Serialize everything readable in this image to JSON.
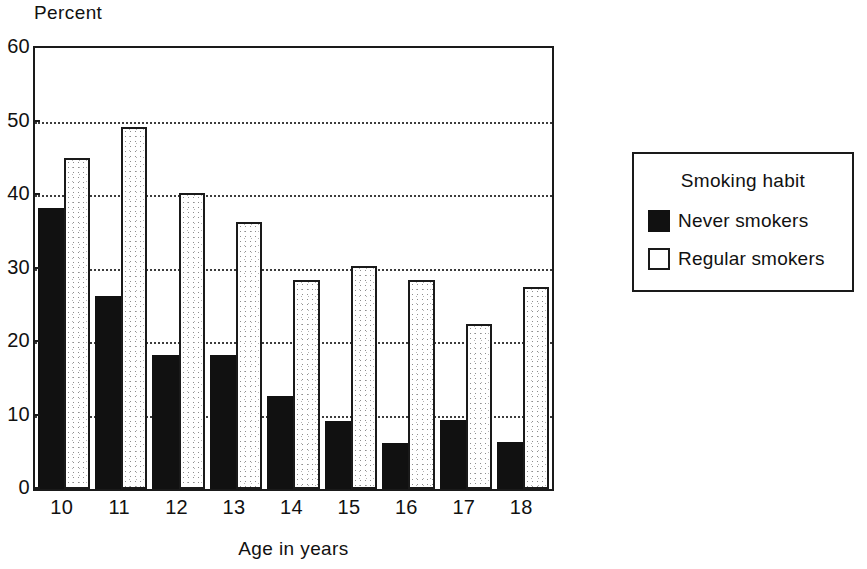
{
  "chart_data": {
    "type": "bar",
    "title": "",
    "xlabel": "Age in years",
    "ylabel": "Percent",
    "categories": [
      "10",
      "11",
      "12",
      "13",
      "14",
      "15",
      "16",
      "17",
      "18"
    ],
    "series": [
      {
        "name": "Never smokers",
        "color": "#111111",
        "values": [
          38.3,
          26.3,
          18.3,
          18.3,
          12.7,
          9.2,
          6.3,
          9.4,
          6.4
        ]
      },
      {
        "name": "Regular smokers",
        "color": "#ffffff",
        "values": [
          45.1,
          49.2,
          40.3,
          36.3,
          28.4,
          30.4,
          28.5,
          22.5,
          27.5
        ]
      }
    ],
    "ylim": [
      0,
      60
    ],
    "yticks": [
      0,
      10,
      20,
      30,
      40,
      50,
      60
    ],
    "ytick_labels": [
      "0",
      "10",
      "20",
      "30",
      "40",
      "50",
      "60"
    ],
    "grid": "horizontal-dotted",
    "legend_position": "right"
  },
  "axes": {
    "y_title": "Percent",
    "x_title": "Age in years"
  },
  "legend": {
    "title": "Smoking habit",
    "entries": [
      {
        "label": "Never smokers",
        "swatch": "filled-black-square"
      },
      {
        "label": "Regular smokers",
        "swatch": "outlined-white-square"
      }
    ]
  }
}
